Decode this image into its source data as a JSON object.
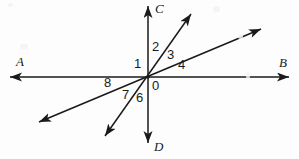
{
  "figure": {
    "background_color": "#fdfdfd",
    "stroke_color": "#1a1a1a",
    "width": 299,
    "height": 159,
    "origin": {
      "x": 148,
      "y": 77
    },
    "lines": [
      {
        "name": "line-AB",
        "kind": "horizontal-line",
        "from": {
          "x": 8,
          "y": 77
        },
        "to": {
          "x": 291,
          "y": 77
        },
        "arrows": "both"
      },
      {
        "name": "line-CD",
        "kind": "vertical-line",
        "from": {
          "x": 148,
          "y": 4
        },
        "to": {
          "x": 148,
          "y": 145
        },
        "arrows": "both"
      },
      {
        "name": "line-steep-oblique",
        "kind": "oblique-line",
        "from": {
          "x": 193,
          "y": 11
        },
        "to": {
          "x": 103,
          "y": 139
        },
        "arrows": "both"
      },
      {
        "name": "line-shallow-oblique",
        "kind": "oblique-line",
        "from": {
          "x": 263,
          "y": 28
        },
        "to": {
          "x": 37,
          "y": 123
        },
        "arrows": "both"
      }
    ],
    "point_labels": [
      {
        "id": "A",
        "text": "A",
        "x": 16,
        "y": 55
      },
      {
        "id": "B",
        "text": "B",
        "x": 279,
        "y": 56
      },
      {
        "id": "C",
        "text": "C",
        "x": 155,
        "y": 2
      },
      {
        "id": "D",
        "text": "D",
        "x": 154,
        "y": 140
      }
    ],
    "angle_labels": [
      {
        "id": "1",
        "text": "1",
        "x": 134,
        "y": 57
      },
      {
        "id": "2",
        "text": "2",
        "x": 152,
        "y": 40
      },
      {
        "id": "3",
        "text": "3",
        "x": 167,
        "y": 48
      },
      {
        "id": "4",
        "text": "4",
        "x": 178,
        "y": 58
      },
      {
        "id": "6",
        "text": "6",
        "x": 136,
        "y": 91
      },
      {
        "id": "7",
        "text": "7",
        "x": 122,
        "y": 88
      },
      {
        "id": "8",
        "text": "8",
        "x": 104,
        "y": 76
      },
      {
        "id": "0",
        "text": "0",
        "x": 152,
        "y": 79
      }
    ]
  }
}
